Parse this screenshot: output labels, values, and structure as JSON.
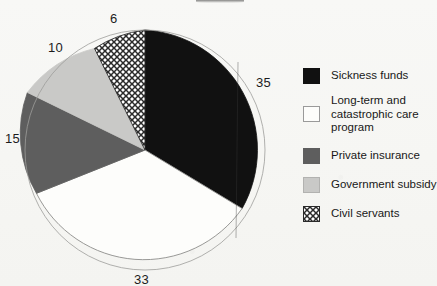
{
  "chart_data": {
    "type": "pie",
    "title": "",
    "categories": [
      "Sickness funds",
      "Long-term and catastrophic care program",
      "Private insurance",
      "Government subsidy",
      "Civil servants"
    ],
    "values": [
      35,
      33,
      15,
      10,
      6
    ],
    "value_labels": [
      "35",
      "33",
      "15",
      "10",
      "6"
    ],
    "units": "percent",
    "total": 99,
    "start_angle_deg": 0,
    "direction": "clockwise",
    "legend_position": "right",
    "grid": false,
    "xlabel": "",
    "ylabel": "",
    "slice_styles": [
      {
        "name": "Sickness funds",
        "fill": "#111111",
        "pattern": "solid",
        "stroke": "#111111"
      },
      {
        "name": "Long-term and catastrophic care program",
        "fill": "#fdfdfb",
        "pattern": "solid",
        "stroke": "#8d8d8b"
      },
      {
        "name": "Private insurance",
        "fill": "#5e5e5e",
        "pattern": "solid",
        "stroke": "#5e5e5e"
      },
      {
        "name": "Government subsidy",
        "fill": "#c9c9c7",
        "pattern": "solid",
        "stroke": "#c9c9c7"
      },
      {
        "name": "Civil servants",
        "fill": "#ffffff",
        "pattern": "cross-hatch",
        "stroke": "#2a2a2a"
      }
    ]
  },
  "pie": {
    "center_x": 145,
    "center_y": 150,
    "radius": 120,
    "labels": {
      "sickness_funds": "35",
      "long_term_care": "33",
      "private_insurance": "15",
      "government_subsidy": "10",
      "civil_servants": "6"
    }
  },
  "legend": {
    "items": [
      {
        "label": "Sickness funds",
        "swatch": "solid-black-swatch"
      },
      {
        "label": "Long-term and\ncatastrophic care\nprogram",
        "swatch": "outline-white-swatch"
      },
      {
        "label": "Private insurance",
        "swatch": "solid-dark-grey-swatch"
      },
      {
        "label": "Government subsidy",
        "swatch": "solid-light-grey-swatch"
      },
      {
        "label": "Civil servants",
        "swatch": "cross-hatch-swatch"
      }
    ]
  },
  "colors": {
    "background": "#f7f7f4",
    "ink": "#1c1c1c",
    "black_slice": "#111111",
    "white_slice": "#fdfdfb",
    "dark_grey_slice": "#5e5e5e",
    "light_grey_slice": "#c9c9c7",
    "hatch_stroke": "#2a2a2a"
  }
}
